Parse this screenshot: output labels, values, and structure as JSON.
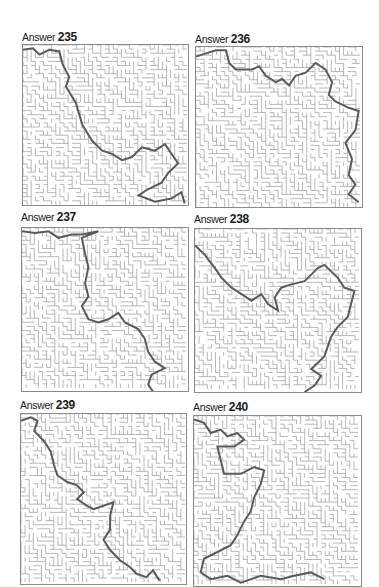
{
  "page": {
    "background": "#ffffff",
    "wall_color": "#9a9a9a",
    "path_color": "#5a5a5a"
  },
  "answers": [
    {
      "label": "Answer",
      "number": "235",
      "path": [
        [
          0,
          3
        ],
        [
          6,
          2
        ],
        [
          10,
          6
        ],
        [
          16,
          3
        ],
        [
          22,
          4
        ],
        [
          24,
          12
        ],
        [
          28,
          20
        ],
        [
          26,
          26
        ],
        [
          32,
          36
        ],
        [
          36,
          50
        ],
        [
          42,
          60
        ],
        [
          48,
          66
        ],
        [
          54,
          68
        ],
        [
          60,
          72
        ],
        [
          66,
          70
        ],
        [
          72,
          64
        ],
        [
          80,
          66
        ],
        [
          86,
          62
        ],
        [
          90,
          68
        ],
        [
          94,
          74
        ],
        [
          88,
          80
        ],
        [
          84,
          86
        ],
        [
          76,
          90
        ],
        [
          70,
          94
        ],
        [
          80,
          98
        ],
        [
          90,
          96
        ],
        [
          96,
          92
        ],
        [
          98,
          99
        ]
      ]
    },
    {
      "label": "Answer",
      "number": "236",
      "path": [
        [
          0,
          6
        ],
        [
          6,
          4
        ],
        [
          12,
          2
        ],
        [
          18,
          2
        ],
        [
          20,
          10
        ],
        [
          24,
          14
        ],
        [
          34,
          14
        ],
        [
          38,
          12
        ],
        [
          42,
          18
        ],
        [
          48,
          22
        ],
        [
          52,
          20
        ],
        [
          56,
          24
        ],
        [
          60,
          18
        ],
        [
          66,
          16
        ],
        [
          72,
          10
        ],
        [
          78,
          14
        ],
        [
          82,
          22
        ],
        [
          80,
          30
        ],
        [
          84,
          34
        ],
        [
          92,
          38
        ],
        [
          98,
          40
        ],
        [
          96,
          52
        ],
        [
          90,
          60
        ],
        [
          94,
          70
        ],
        [
          92,
          80
        ],
        [
          96,
          86
        ],
        [
          92,
          92
        ],
        [
          98,
          97
        ]
      ]
    },
    {
      "label": "Answer",
      "number": "237",
      "path": [
        [
          0,
          2
        ],
        [
          8,
          3
        ],
        [
          16,
          2
        ],
        [
          22,
          6
        ],
        [
          30,
          4
        ],
        [
          36,
          4
        ],
        [
          46,
          2
        ],
        [
          36,
          6
        ],
        [
          38,
          16
        ],
        [
          40,
          24
        ],
        [
          38,
          34
        ],
        [
          40,
          42
        ],
        [
          36,
          48
        ],
        [
          40,
          56
        ],
        [
          46,
          58
        ],
        [
          52,
          56
        ],
        [
          58,
          52
        ],
        [
          62,
          58
        ],
        [
          70,
          62
        ],
        [
          74,
          68
        ],
        [
          76,
          76
        ],
        [
          80,
          82
        ],
        [
          86,
          86
        ],
        [
          78,
          90
        ],
        [
          76,
          96
        ],
        [
          80,
          102
        ]
      ]
    },
    {
      "label": "Answer",
      "number": "238",
      "path": [
        [
          0,
          10
        ],
        [
          6,
          16
        ],
        [
          12,
          24
        ],
        [
          16,
          30
        ],
        [
          22,
          36
        ],
        [
          28,
          40
        ],
        [
          34,
          44
        ],
        [
          40,
          40
        ],
        [
          44,
          46
        ],
        [
          50,
          50
        ],
        [
          48,
          42
        ],
        [
          52,
          36
        ],
        [
          58,
          34
        ],
        [
          66,
          32
        ],
        [
          70,
          28
        ],
        [
          74,
          24
        ],
        [
          78,
          22
        ],
        [
          82,
          26
        ],
        [
          86,
          30
        ],
        [
          90,
          36
        ],
        [
          96,
          38
        ],
        [
          94,
          46
        ],
        [
          92,
          54
        ],
        [
          86,
          60
        ],
        [
          82,
          66
        ],
        [
          80,
          72
        ],
        [
          78,
          78
        ],
        [
          74,
          82
        ],
        [
          70,
          86
        ],
        [
          76,
          90
        ],
        [
          72,
          96
        ],
        [
          66,
          100
        ]
      ]
    },
    {
      "label": "Answer",
      "number": "239",
      "path": [
        [
          0,
          4
        ],
        [
          6,
          2
        ],
        [
          10,
          4
        ],
        [
          8,
          10
        ],
        [
          14,
          16
        ],
        [
          18,
          22
        ],
        [
          20,
          30
        ],
        [
          22,
          36
        ],
        [
          28,
          40
        ],
        [
          34,
          42
        ],
        [
          38,
          46
        ],
        [
          34,
          50
        ],
        [
          40,
          54
        ],
        [
          44,
          56
        ],
        [
          50,
          54
        ],
        [
          56,
          52
        ],
        [
          54,
          60
        ],
        [
          54,
          68
        ],
        [
          50,
          74
        ],
        [
          54,
          80
        ],
        [
          60,
          86
        ],
        [
          66,
          90
        ],
        [
          70,
          94
        ],
        [
          76,
          96
        ],
        [
          80,
          92
        ],
        [
          84,
          98
        ]
      ]
    },
    {
      "label": "Answer",
      "number": "240",
      "path": [
        [
          0,
          2
        ],
        [
          6,
          4
        ],
        [
          10,
          10
        ],
        [
          16,
          8
        ],
        [
          20,
          12
        ],
        [
          26,
          10
        ],
        [
          30,
          14
        ],
        [
          24,
          18
        ],
        [
          14,
          18
        ],
        [
          16,
          26
        ],
        [
          18,
          34
        ],
        [
          28,
          34
        ],
        [
          36,
          30
        ],
        [
          42,
          32
        ],
        [
          40,
          40
        ],
        [
          36,
          48
        ],
        [
          34,
          56
        ],
        [
          30,
          62
        ],
        [
          26,
          70
        ],
        [
          22,
          76
        ],
        [
          14,
          80
        ],
        [
          6,
          84
        ],
        [
          4,
          92
        ],
        [
          10,
          96
        ],
        [
          20,
          94
        ],
        [
          28,
          98
        ],
        [
          40,
          94
        ],
        [
          52,
          96
        ],
        [
          60,
          94
        ],
        [
          70,
          92
        ],
        [
          78,
          96
        ]
      ]
    }
  ]
}
